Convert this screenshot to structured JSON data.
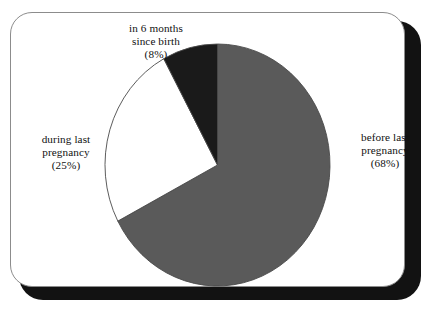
{
  "figure": {
    "background_color": "#ffffff",
    "frame": {
      "border_color": "#8c8c8c",
      "shadow_color": "#121212",
      "corner_radius_px": 22
    }
  },
  "chart_data": {
    "type": "pie",
    "title": "",
    "subtitle": "",
    "xlabel": "",
    "ylabel": "",
    "legend_position": "none",
    "grid": false,
    "units": "percent",
    "start_angle_deg": 90,
    "direction": "clockwise",
    "categories": [
      "before last pregnancy",
      "during last pregnancy",
      "in 6 months since birth"
    ],
    "values": [
      68,
      25,
      8
    ],
    "labels_formatted": [
      "(68%)",
      "(25%)",
      "(8%)"
    ],
    "colors": [
      "#5a5a5a",
      "#ffffff",
      "#1a1a1a"
    ],
    "slices": [
      {
        "name": "before last pregnancy",
        "value": 68,
        "value_label": "(68%)",
        "color": "#5a5a5a",
        "label_lines": [
          "before last",
          "pregnancy",
          "(68%)"
        ],
        "label_position": "right"
      },
      {
        "name": "during last pregnancy",
        "value": 25,
        "value_label": "(25%)",
        "color": "#ffffff",
        "label_lines": [
          "during last",
          "pregnancy",
          "(25%)"
        ],
        "label_position": "left"
      },
      {
        "name": "in 6 months since birth",
        "value": 8,
        "value_label": "(8%)",
        "color": "#1a1a1a",
        "label_lines": [
          "in 6 months",
          "since birth",
          "(8%)"
        ],
        "label_position": "top"
      }
    ]
  },
  "labels": {
    "top": {
      "line1": "in 6 months",
      "line2": "since birth",
      "line3": "(8%)"
    },
    "left": {
      "line1": "during last",
      "line2": "pregnancy",
      "line3": "(25%)"
    },
    "right": {
      "line1": "before last",
      "line2": "pregnancy",
      "line3": "(68%)"
    }
  }
}
